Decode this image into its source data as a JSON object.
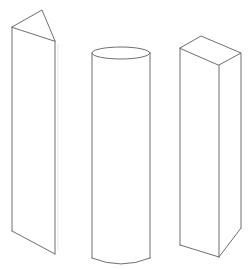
{
  "figure": {
    "background": "#ffffff",
    "stroke_color": "#6e6e6e",
    "shapes": [
      {
        "name": "triangular-prism",
        "label": "",
        "vertices": {
          "top_apex": [
            42,
            10
          ],
          "top_left": [
            12,
            27
          ],
          "top_front": [
            55,
            41
          ],
          "bottom_left": [
            12,
            231
          ],
          "bottom_front": [
            55,
            254
          ]
        }
      },
      {
        "name": "cylinder",
        "label": "",
        "top_ellipse": {
          "cx": 121,
          "cy": 53,
          "rx": 29,
          "ry": 6
        },
        "bottom_y": 258,
        "left_x": 92,
        "right_x": 150
      },
      {
        "name": "rectangular-prism",
        "label": "",
        "vertices": {
          "top_back": [
            201,
            36
          ],
          "top_right": [
            241,
            53
          ],
          "top_front": [
            219,
            65
          ],
          "top_left": [
            180,
            48
          ],
          "bottom_left": [
            180,
            245
          ],
          "bottom_front": [
            219,
            257
          ],
          "bottom_right": [
            241,
            228
          ]
        }
      }
    ]
  }
}
